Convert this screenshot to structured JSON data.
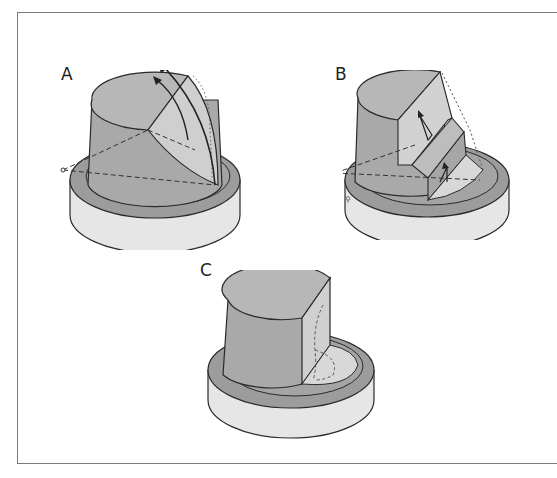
{
  "figure": {
    "panels": [
      {
        "id": "A",
        "label": "A"
      },
      {
        "id": "B",
        "label": "B"
      },
      {
        "id": "C",
        "label": "C"
      }
    ],
    "caption": ""
  },
  "colors": {
    "body": "#a9a9a9",
    "top": "#b7b7b7",
    "cut_face": "#d2d2d2",
    "ring": "#9c9c9c",
    "base_side": "#e6e6e6",
    "stroke": "#2a2a2a",
    "frame": "#7a7a7a"
  }
}
